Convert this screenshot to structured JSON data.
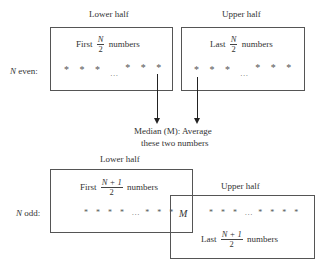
{
  "even": {
    "row_label_var": "N",
    "row_label_text": " even:",
    "lower_half": {
      "title": "Lower half",
      "prefix": "First",
      "frac_num": "N",
      "frac_den": "2",
      "suffix": "numbers",
      "stars_left": "* * *",
      "ellipsis": "...",
      "stars_right": "* * *"
    },
    "upper_half": {
      "title": "Upper half",
      "prefix": "Last",
      "frac_num": "N",
      "frac_den": "2",
      "suffix": "numbers",
      "stars_left": "* * *",
      "ellipsis": "...",
      "stars_right": "* * *"
    },
    "median_caption_line1": "Median (M): Average",
    "median_caption_line2": "these two numbers"
  },
  "odd": {
    "row_label_var": "N",
    "row_label_text": " odd:",
    "lower_half": {
      "title": "Lower half",
      "prefix": "First",
      "frac_num": "N + 1",
      "frac_den": "2",
      "suffix": "numbers",
      "stars_left": "* * * *",
      "ellipsis": "...",
      "stars_right": "* * *"
    },
    "median_label": "M",
    "upper_half": {
      "title": "Upper half",
      "prefix": "Last",
      "frac_num": "N + 1",
      "frac_den": "2",
      "suffix": "numbers",
      "stars_left": "* * *",
      "ellipsis": "...",
      "stars_right": "* * * *"
    }
  }
}
